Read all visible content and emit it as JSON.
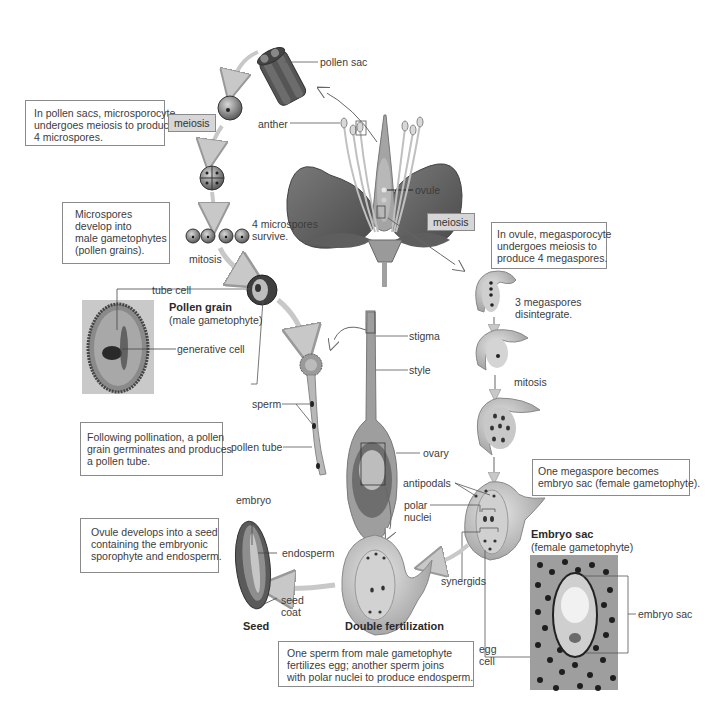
{
  "diagram": {
    "colors": {
      "background": "#ffffff",
      "box_border": "#8a8a8a",
      "tag_fill": "#d6d6d6",
      "tissue_gray": "#9a9a9a",
      "arrow_fill": "#c8c8c8",
      "text": "#3c3c3c"
    },
    "captions": {
      "microsporocyte": [
        "In pollen sacs, microsporocyte",
        "undergoes meiosis to produce",
        "4 microspores."
      ],
      "microspores": [
        "Microspores",
        "develop into",
        "male gametophytes",
        "(pollen grains)."
      ],
      "pollination": [
        "Following pollination, a pollen",
        "grain germinates and produces",
        "a pollen tube."
      ],
      "seed": [
        "Ovule develops into a seed",
        "containing the embryonic",
        "sporophyte and endosperm."
      ],
      "double_fertilization": [
        "One sperm from male gametophyte",
        "fertilizes egg; another sperm joins",
        "with polar nuclei to produce endosperm."
      ],
      "megasporocyte": [
        "In ovule, megasporocyte",
        "undergoes meiosis to",
        "produce 4 megaspores."
      ],
      "embryo_sac": [
        "One megaspore becomes",
        "embryo sac (female gametophyte)."
      ]
    },
    "tags": {
      "meiosis_left": "meiosis",
      "meiosis_right": "meiosis"
    },
    "labels": {
      "pollen_sac": "pollen sac",
      "anther": "anther",
      "ovule": "ovule",
      "four_microspores": [
        "4 microspores",
        "survive."
      ],
      "mitosis_left": "mitosis",
      "tube_cell": "tube cell",
      "pollen_grain_title": "Pollen grain",
      "pollen_grain_sub": "(male gametophyte)",
      "generative_cell": "generative cell",
      "stigma": "stigma",
      "style": "style",
      "sperm": "sperm",
      "pollen_tube": "pollen tube",
      "ovary": "ovary",
      "three_megaspores": [
        "3 megaspores",
        "disintegrate."
      ],
      "mitosis_right": "mitosis",
      "antipodals": "antipodals",
      "polar_nuclei": [
        "polar",
        "nuclei"
      ],
      "synergids": "synergids",
      "egg_cell": [
        "egg",
        "cell"
      ],
      "embryo_sac_title": "Embryo sac",
      "embryo_sac_sub": "(female gametophyte)",
      "embryo_sac_label": "embryo sac",
      "embryo": "embryo",
      "endosperm": "endosperm",
      "seed_coat": [
        "seed",
        "coat"
      ],
      "seed_title": "Seed",
      "double_fertilization_title": "Double fertilization"
    }
  }
}
